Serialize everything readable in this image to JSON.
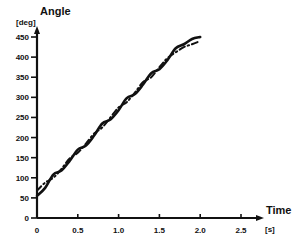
{
  "chart_data": {
    "type": "line",
    "title": "",
    "xlabel": "Time",
    "xunit": "[s]",
    "ylabel": "Angle",
    "yunit": "[deg]",
    "xlim": [
      0,
      2.5
    ],
    "ylim": [
      0,
      450
    ],
    "x_ticks": [
      0,
      0.5,
      1.0,
      1.5,
      2.0,
      2.5
    ],
    "x_tick_labels": [
      "0",
      "0.5",
      "1.0",
      "1.5",
      "2.0",
      "2.5"
    ],
    "y_ticks": [
      0,
      50,
      100,
      150,
      200,
      250,
      300,
      350,
      400,
      450
    ],
    "y_tick_labels": [
      "0",
      "50",
      "100",
      "150",
      "200",
      "250",
      "300",
      "350",
      "400",
      "450"
    ],
    "grid": false,
    "legend": null,
    "series": [
      {
        "name": "solid",
        "style": "solid",
        "x": [
          0,
          0.1,
          0.2,
          0.3,
          0.4,
          0.5,
          0.6,
          0.7,
          0.8,
          0.9,
          1.0,
          1.1,
          1.2,
          1.3,
          1.4,
          1.5,
          1.6,
          1.7,
          1.8,
          1.9,
          2.0
        ],
        "values": [
          55,
          75,
          108,
          118,
          142,
          170,
          180,
          205,
          235,
          245,
          268,
          298,
          308,
          332,
          360,
          370,
          393,
          422,
          432,
          445,
          450
        ]
      },
      {
        "name": "dash-dot",
        "style": "dashdot",
        "x": [
          0,
          0.1,
          0.2,
          0.3,
          0.4,
          0.5,
          0.6,
          0.7,
          0.8,
          0.9,
          1.0,
          1.1,
          1.2,
          1.3,
          1.4,
          1.5,
          1.6,
          1.7,
          1.8,
          1.9,
          2.0
        ],
        "values": [
          68,
          88,
          100,
          122,
          148,
          162,
          185,
          210,
          225,
          250,
          275,
          288,
          312,
          338,
          350,
          375,
          398,
          412,
          425,
          432,
          440
        ]
      }
    ]
  },
  "layout": {
    "x_origin_px": 37,
    "x_px_per_unit": 81.6,
    "y_origin_px": 218,
    "y_px_per_unit": 0.4022,
    "line_color": "#111111"
  }
}
